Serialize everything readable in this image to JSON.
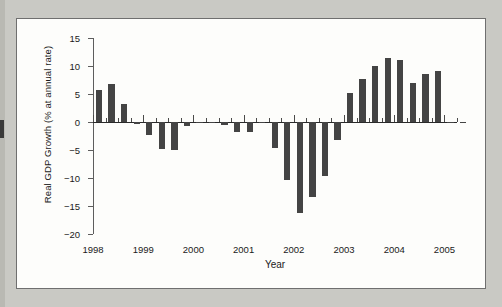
{
  "figure": {
    "background_color": "#fdfdfb",
    "page_color": "#c9c9c4",
    "bar_color": "#444444",
    "axis_color": "#5d5d5d"
  },
  "chart_data": {
    "type": "bar",
    "title": "",
    "xlabel": "Year",
    "ylabel": "Real GDP Growth (% at annual rate)",
    "ylim": [
      -20,
      15
    ],
    "yticks": [
      15,
      10,
      5,
      0,
      -5,
      -10,
      -15,
      -20
    ],
    "ytick_labels": [
      "15",
      "10",
      "5",
      "0",
      "−5",
      "−10",
      "−15",
      "−20"
    ],
    "xlim": [
      1998.0,
      2005.25
    ],
    "xticks": [
      1998,
      1999,
      2000,
      2001,
      2002,
      2003,
      2004,
      2005
    ],
    "xtick_labels": [
      "1998",
      "1999",
      "2000",
      "2001",
      "2002",
      "2003",
      "2004",
      "2005"
    ],
    "grid": false,
    "legend": "none",
    "frequency": "quarterly",
    "categories": [
      "1998 Q1",
      "1998 Q2",
      "1998 Q3",
      "1998 Q4",
      "1999 Q1",
      "1999 Q2",
      "1999 Q3",
      "1999 Q4",
      "2000 Q1",
      "2000 Q2",
      "2000 Q3",
      "2000 Q4",
      "2001 Q1",
      "2001 Q2",
      "2001 Q3",
      "2001 Q4",
      "2002 Q1",
      "2002 Q2",
      "2002 Q3",
      "2002 Q4",
      "2003 Q1",
      "2003 Q2",
      "2003 Q3",
      "2003 Q4",
      "2004 Q1",
      "2004 Q2",
      "2004 Q3",
      "2004 Q4",
      "2005 Q1",
      "2005 Q2"
    ],
    "x": [
      1998.0,
      1998.25,
      1998.5,
      1998.75,
      1999.0,
      1999.25,
      1999.5,
      1999.75,
      2000.0,
      2000.25,
      2000.5,
      2000.75,
      2001.0,
      2001.25,
      2001.5,
      2001.75,
      2002.0,
      2002.25,
      2002.5,
      2002.75,
      2003.0,
      2003.25,
      2003.5,
      2003.75,
      2004.0,
      2004.25,
      2004.5,
      2004.75,
      2005.0,
      2005.25
    ],
    "values": [
      5.8,
      6.7,
      3.2,
      -0.4,
      -2.4,
      -4.8,
      -5.0,
      -0.7,
      -0.1,
      -0.2,
      -0.5,
      -1.7,
      -1.8,
      -0.2,
      -4.7,
      -10.3,
      -16.2,
      -13.4,
      -9.7,
      -3.3,
      5.2,
      7.6,
      10.0,
      11.5,
      11.1,
      6.9,
      8.5,
      9.1,
      -0.2,
      -0.1
    ],
    "max_value": 11.5,
    "min_value": -16.2
  }
}
